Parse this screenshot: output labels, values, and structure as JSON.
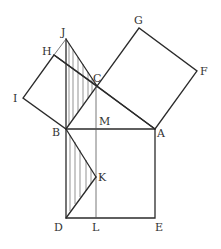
{
  "diagram": {
    "type": "geometry",
    "colors": {
      "line": "#2b2b2b",
      "label": "#333333",
      "background": "#ffffff"
    },
    "points": {
      "A": [
        155,
        129
      ],
      "B": [
        66,
        129
      ],
      "C": [
        97,
        86
      ],
      "D": [
        66,
        218
      ],
      "E": [
        155,
        218
      ],
      "F": [
        197,
        71
      ],
      "G": [
        139,
        28
      ],
      "H": [
        54,
        55
      ],
      "I": [
        23,
        98
      ],
      "J": [
        66,
        39
      ],
      "K": [
        96,
        177
      ],
      "L": [
        96,
        218
      ],
      "M": [
        96,
        129
      ]
    },
    "labels": [
      {
        "text": "J",
        "x": 61,
        "y": 36
      },
      {
        "text": "H",
        "x": 42,
        "y": 55
      },
      {
        "text": "G",
        "x": 134,
        "y": 24
      },
      {
        "text": "F",
        "x": 200,
        "y": 75
      },
      {
        "text": "C",
        "x": 93,
        "y": 82
      },
      {
        "text": "I",
        "x": 13,
        "y": 102
      },
      {
        "text": "M",
        "x": 99,
        "y": 125
      },
      {
        "text": "B",
        "x": 52,
        "y": 136
      },
      {
        "text": "A",
        "x": 157,
        "y": 137
      },
      {
        "text": "K",
        "x": 98,
        "y": 181
      },
      {
        "text": "D",
        "x": 54,
        "y": 231
      },
      {
        "text": "L",
        "x": 92,
        "y": 231
      },
      {
        "text": "E",
        "x": 155,
        "y": 231
      }
    ]
  }
}
